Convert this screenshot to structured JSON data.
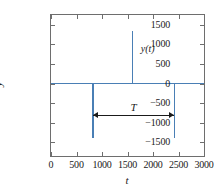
{
  "chart_data": {
    "type": "line",
    "title": "",
    "xlabel": "t",
    "ylabel": "y",
    "xlim": [
      0,
      3000
    ],
    "ylim": [
      -1850,
      1750
    ],
    "grid": false,
    "legend_position": "none",
    "x_ticks": [
      0,
      500,
      1000,
      1500,
      2000,
      2500,
      3000
    ],
    "x_tick_labels": [
      "0",
      "500",
      "1000",
      "1500",
      "2000",
      "2500",
      "3000"
    ],
    "y_ticks": [
      1500,
      1000,
      500,
      0,
      -500,
      -1000,
      -1500
    ],
    "y_tick_labels": [
      "1500",
      "1000",
      "500",
      "0",
      "-500",
      "-1000",
      "-1500"
    ],
    "series": [
      {
        "name": "y(t)",
        "color": "#4a7fb5",
        "baseline": 0,
        "impulses": [
          {
            "t": 820,
            "value": -1380
          },
          {
            "t": 1600,
            "value": 1350
          },
          {
            "t": 2420,
            "value": -1380
          }
        ]
      }
    ],
    "annotations": [
      {
        "name": "curve-label",
        "text": "y(t)",
        "t": 1700,
        "value": 900
      },
      {
        "name": "period-arrow-label",
        "text": "T",
        "t_start": 820,
        "t_end": 2420,
        "value": -800
      }
    ]
  },
  "labels": {
    "curve": "y(t)",
    "period": "T",
    "axis_x": "t",
    "axis_y": "y"
  },
  "colors": {
    "series": "#4a7fb5",
    "frame": "#6e6e6e",
    "annotation": "#1a1a1a",
    "background": "#ffffff"
  }
}
